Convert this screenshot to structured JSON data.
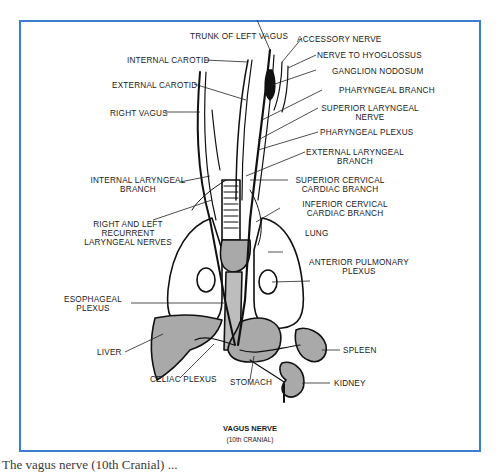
{
  "figure": {
    "border_color": "#3a7fcf",
    "organ_fill": "#a9a9a9",
    "title": "VAGUS NERVE",
    "subtitle": "(10th CRANIAL)"
  },
  "labels": {
    "trunk_left_vagus": "TRUNK OF LEFT VAGUS",
    "accessory_nerve": "ACCESSORY NERVE",
    "internal_carotid": "INTERNAL CAROTID",
    "nerve_hyoglossus": "NERVE TO HYOGLOSSUS",
    "ganglion_nodosum": "GANGLION NODOSUM",
    "external_carotid": "EXTERNAL CAROTID",
    "pharyngeal_branch": "PHARYNGEAL BRANCH",
    "right_vagus": "RIGHT VAGUS",
    "superior_laryngeal_1": "SUPERIOR LARYNGEAL",
    "superior_laryngeal_2": "NERVE",
    "pharyngeal_plexus": "PHARYNGEAL PLEXUS",
    "external_laryngeal_1": "EXTERNAL LARYNGEAL",
    "external_laryngeal_2": "BRANCH",
    "internal_laryngeal_1": "INTERNAL LARYNGEAL",
    "internal_laryngeal_2": "BRANCH",
    "sup_cervical_1": "SUPERIOR CERVICAL",
    "sup_cervical_2": "CARDIAC BRANCH",
    "inf_cervical_1": "INFERIOR CERVICAL",
    "inf_cervical_2": "CARDIAC BRANCH",
    "recurrent_1": "RIGHT AND LEFT",
    "recurrent_2": "RECURRENT",
    "recurrent_3": "LARYNGEAL NERVES",
    "lung": "LUNG",
    "ant_pulmonary_1": "ANTERIOR PULMONARY",
    "ant_pulmonary_2": "PLEXUS",
    "esophageal_1": "ESOPHAGEAL",
    "esophageal_2": "PLEXUS",
    "spleen": "SPLEEN",
    "liver": "LIVER",
    "kidney": "KIDNEY",
    "celiac_plexus": "CELIAC PLEXUS",
    "stomach": "STOMACH"
  },
  "below_text": "The vagus nerve (10th Cranial) ..."
}
